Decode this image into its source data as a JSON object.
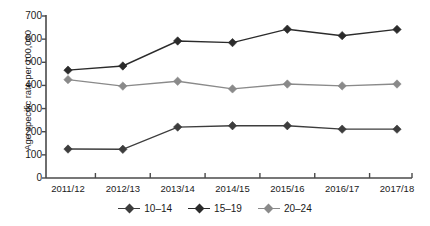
{
  "chart_data": {
    "type": "line",
    "title": "",
    "xlabel": "",
    "ylabel": "Age specific rate per 100,000",
    "ylim": [
      0,
      700
    ],
    "ytick_values": [
      0,
      100,
      200,
      300,
      400,
      500,
      600,
      700
    ],
    "ytick_labels": [
      "0",
      "100",
      "200",
      "300",
      "400",
      "500",
      "600",
      "700"
    ],
    "grid": false,
    "legend_position": "bottom-center",
    "categories": [
      "2011/12",
      "2012/13",
      "2013/14",
      "2014/15",
      "2015/16",
      "2016/17",
      "2017/18"
    ],
    "series": [
      {
        "name": "10–14",
        "color": "#3d3d3d",
        "marker": "diamond",
        "values": [
          125,
          124,
          220,
          226,
          226,
          211,
          211
        ]
      },
      {
        "name": "15–19",
        "color": "#2b2b2b",
        "marker": "diamond",
        "values": [
          466,
          484,
          592,
          585,
          643,
          615,
          642
        ]
      },
      {
        "name": "20–24",
        "color": "#8a8a8a",
        "marker": "diamond",
        "values": [
          425,
          397,
          418,
          385,
          406,
          398,
          406
        ]
      }
    ]
  },
  "axis": {
    "line_color": "#4a4a4a"
  }
}
